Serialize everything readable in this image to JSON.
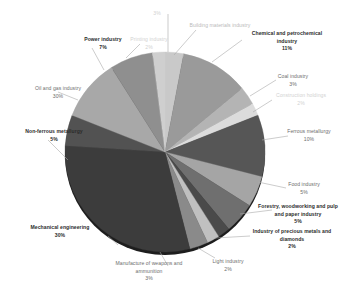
{
  "chart_data": {
    "type": "pie",
    "title": "",
    "legend_position": "labels-outside",
    "units": "percent",
    "categories": [
      "Building materials industry",
      "Chemical and petrochemical industry",
      "Coal industry",
      "Construction holdings",
      "Ferrous metallurgy",
      "Food industry",
      "Forestry, woodworking and pulp and paper industry",
      "Industry of precious metals and diamonds",
      "Light industry",
      "Manufacture of weapons and ammunition",
      "Mechanical engineering",
      "Non-ferrous metallurgy",
      "Oil and gas industry",
      "Power industry",
      "Printing industry"
    ],
    "values": [
      3,
      11,
      3,
      2,
      10,
      5,
      5,
      2,
      2,
      3,
      30,
      5,
      10,
      7,
      2
    ],
    "slices": [
      {
        "label": "Building materials industry",
        "value": 3,
        "pct_text": "3%",
        "color": "#c9c9c9"
      },
      {
        "label": "Chemical and petrochemical industry",
        "value": 11,
        "pct_text": "11%",
        "color": "#9a9a9a"
      },
      {
        "label": "Coal industry",
        "value": 3,
        "pct_text": "3%",
        "color": "#b4b4b4"
      },
      {
        "label": "Construction holdings",
        "value": 2,
        "pct_text": "2%",
        "color": "#dcdcdc"
      },
      {
        "label": "Ferrous metallurgy",
        "value": 10,
        "pct_text": "10%",
        "color": "#565656"
      },
      {
        "label": "Food industry",
        "value": 5,
        "pct_text": "5%",
        "color": "#a5a5a5"
      },
      {
        "label": "Forestry, woodworking and pulp and paper industry",
        "value": 5,
        "pct_text": "5%",
        "color": "#6f6f6f"
      },
      {
        "label": "Industry of precious metals and diamonds",
        "value": 2,
        "pct_text": "2%",
        "color": "#4a4a4a"
      },
      {
        "label": "Light industry",
        "value": 2,
        "pct_text": "2%",
        "color": "#c0c0c0"
      },
      {
        "label": "Manufacture of weapons and ammunition",
        "value": 3,
        "pct_text": "3%",
        "color": "#8a8a8a"
      },
      {
        "label": "Mechanical engineering",
        "value": 30,
        "pct_text": "30%",
        "color": "#3c3c3c"
      },
      {
        "label": "Non-ferrous metallurgy",
        "value": 5,
        "pct_text": "5%",
        "color": "#525252"
      },
      {
        "label": "Oil and gas industry",
        "value": 10,
        "pct_text": "10%",
        "color": "#a8a8a8"
      },
      {
        "label": "Power industry",
        "value": 7,
        "pct_text": "7%",
        "color": "#8f8f8f"
      },
      {
        "label": "Printing industry",
        "value": 2,
        "pct_text": "2%",
        "color": "#cfcfcf"
      }
    ]
  },
  "labels": {
    "printing_industry": {
      "name": "Printing industry",
      "pct": "2%"
    },
    "top_small": {
      "pct": "3%"
    },
    "building_materials": {
      "name": "Building materials industry",
      "pct": ""
    },
    "chemical": {
      "name_line1": "Chemical and petrochemical",
      "name_line2": "industry",
      "pct": "11%"
    },
    "coal": {
      "name": "Coal industry",
      "pct": "3%"
    },
    "construction_holdings": {
      "name": "Construction holdings",
      "pct": "2%"
    },
    "ferrous": {
      "name": "Ferrous metallurgy",
      "pct": "10%"
    },
    "food": {
      "name": "Food industry",
      "pct": "5%"
    },
    "forestry": {
      "name_line1": "Forestry, woodworking and pulp",
      "name_line2": "and paper industry",
      "pct": "5%"
    },
    "precious_metals": {
      "name_line1": "Industry of precious metals and",
      "name_line2": "diamonds",
      "pct": "2%"
    },
    "light_industry": {
      "name": "Light industry",
      "pct": "2%"
    },
    "weapons": {
      "name_line1": "Manufacture of weapons and",
      "name_line2": "ammunition",
      "pct": "3%"
    },
    "mechanical": {
      "name": "Mechanical engineering",
      "pct": "30%"
    },
    "non_ferrous": {
      "name": "Non-ferrous metallurgy",
      "pct": "5%"
    },
    "oil_gas": {
      "name": "Oil and gas industry",
      "pct": "30%"
    },
    "power": {
      "name": "Power industry",
      "pct": "7%"
    }
  }
}
